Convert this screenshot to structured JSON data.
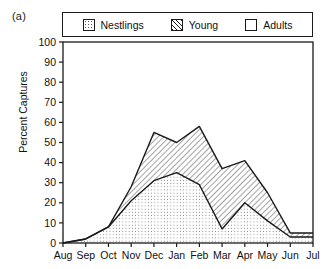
{
  "panel": {
    "label": "(a)"
  },
  "legend": {
    "items": [
      {
        "label": "Nestlings",
        "swatch": "dotted-square-icon",
        "fill": "dots"
      },
      {
        "label": "Young",
        "swatch": "hatched-square-icon",
        "fill": "hatch"
      },
      {
        "label": "Adults",
        "swatch": "empty-square-icon",
        "fill": "none"
      }
    ]
  },
  "axes": {
    "ylabel": "Percent Captures",
    "xlabel": "",
    "yticks": [
      100,
      90,
      80,
      70,
      60,
      50,
      40,
      30,
      20,
      10,
      0
    ],
    "xticks": [
      "Aug",
      "Sep",
      "Oct",
      "Nov",
      "Dec",
      "Jan",
      "Feb",
      "Mar",
      "Apr",
      "May",
      "Jun",
      "Jul"
    ]
  },
  "colors": {
    "line": "#1a1a1a",
    "frame": "#1a1a1a",
    "background": "#ffffff",
    "hatch": "#1a1a1a",
    "stipple": "#555555"
  },
  "chart_data": {
    "type": "area",
    "title": "",
    "subtitle": "",
    "xlabel": "",
    "ylabel": "Percent Captures",
    "ylim": [
      0,
      100
    ],
    "grid": false,
    "legend_position": "top",
    "categories": [
      "Aug",
      "Sep",
      "Oct",
      "Nov",
      "Dec",
      "Jan",
      "Feb",
      "Mar",
      "Apr",
      "May",
      "Jun",
      "Jul"
    ],
    "series": [
      {
        "name": "Nestlings",
        "pattern": "stipple",
        "values": [
          0,
          2,
          8,
          21,
          31,
          35,
          29,
          7,
          20,
          11,
          3,
          3
        ]
      },
      {
        "name": "Young",
        "pattern": "hatch",
        "values": [
          0,
          2,
          8,
          28,
          55,
          50,
          58,
          37,
          41,
          25,
          5,
          5
        ]
      },
      {
        "name": "Adults",
        "pattern": "none",
        "values": [
          0,
          0,
          0,
          0,
          0,
          0,
          0,
          0,
          0,
          0,
          0,
          0
        ]
      }
    ]
  }
}
